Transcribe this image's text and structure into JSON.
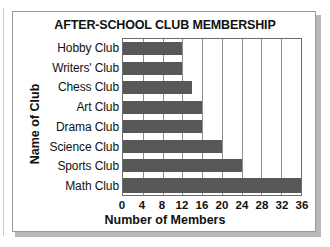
{
  "chart_data": {
    "type": "bar",
    "orientation": "horizontal",
    "title": "AFTER-SCHOOL CLUB MEMBERSHIP",
    "xlabel": "Number of Members",
    "ylabel": "Name of Club",
    "categories": [
      "Hobby Club",
      "Writers' Club",
      "Chess Club",
      "Art Club",
      "Drama Club",
      "Science Club",
      "Sports Club",
      "Math Club"
    ],
    "values": [
      12,
      12,
      14,
      16,
      16,
      20,
      24,
      36
    ],
    "xlim": [
      0,
      36
    ],
    "xticks": [
      0,
      4,
      8,
      12,
      16,
      20,
      24,
      28,
      32,
      36
    ],
    "xtick_labels": [
      "0",
      "4",
      "8",
      "12",
      "16",
      "20",
      "24",
      "28",
      "32",
      "36"
    ],
    "grid": "vertical",
    "legend": "none",
    "bar_color": "#585858",
    "plot_background": "#ffffff",
    "axis_color": "#6d6d6d"
  }
}
